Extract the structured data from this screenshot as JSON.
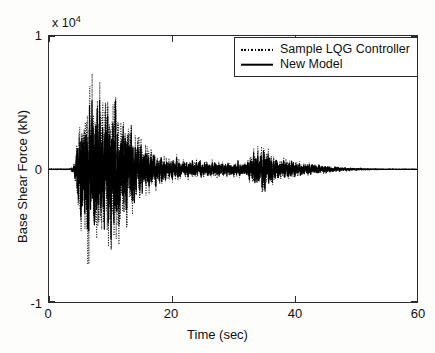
{
  "chart_data": {
    "type": "line",
    "title": "",
    "xlabel": "Time (sec)",
    "ylabel": "Base Shear Force (kN)",
    "y_multiplier": "x 10",
    "y_multiplier_exponent": "4",
    "xlim": [
      0,
      60
    ],
    "ylim": [
      -1,
      1
    ],
    "xticks": [
      0,
      20,
      40,
      60
    ],
    "xtick_labels": [
      "0",
      "20",
      "40",
      "60"
    ],
    "yticks": [
      -1,
      0,
      1
    ],
    "ytick_labels": [
      "-1",
      "0",
      "1"
    ],
    "grid": false,
    "legend_position": "top-right",
    "series": [
      {
        "name": "Sample LQG Controller",
        "style": "dotted",
        "color": "#000000",
        "peak_positive": 8700,
        "peak_negative": -9000,
        "peak_positive_time": 9.2,
        "peak_negative_time": 10.6
      },
      {
        "name": "New Model",
        "style": "solid",
        "color": "#000000",
        "peak_positive": 7800,
        "peak_negative": -8200,
        "peak_positive_time": 9.2,
        "peak_negative_time": 10.4
      }
    ],
    "envelope_description": "Seismic base shear response: near-zero 0-4 s, strong shaking 4-16 s peaking near +/-0.9e4 kN around 6-11 s, decaying 16-32 s, secondary burst near 34-36 s reaching about +/-0.3e4 kN, then decaying to near zero by 48-60 s.",
    "envelope_markers": [
      {
        "time": 0,
        "amplitude": 150
      },
      {
        "time": 4,
        "amplitude": 300
      },
      {
        "time": 5,
        "amplitude": 5800
      },
      {
        "time": 6.5,
        "amplitude": 8600
      },
      {
        "time": 9.2,
        "amplitude": 8700
      },
      {
        "time": 10.6,
        "amplitude": 9000
      },
      {
        "time": 12,
        "amplitude": 6000
      },
      {
        "time": 14,
        "amplitude": 4200
      },
      {
        "time": 16,
        "amplitude": 2400
      },
      {
        "time": 20,
        "amplitude": 1200
      },
      {
        "time": 26,
        "amplitude": 900
      },
      {
        "time": 32,
        "amplitude": 800
      },
      {
        "time": 34.8,
        "amplitude": 3000
      },
      {
        "time": 37,
        "amplitude": 1400
      },
      {
        "time": 42,
        "amplitude": 700
      },
      {
        "time": 48,
        "amplitude": 250
      },
      {
        "time": 55,
        "amplitude": 120
      },
      {
        "time": 60,
        "amplitude": 80
      }
    ]
  },
  "legend": {
    "entries": [
      {
        "label": "Sample LQG Controller",
        "marker": "dotted-line-sample"
      },
      {
        "label": "New Model",
        "marker": "solid-line-sample"
      }
    ]
  },
  "axes": {
    "x_title": "Time (sec)",
    "y_title": "Base Shear Force (kN)",
    "x_tick_labels": [
      "0",
      "20",
      "40",
      "60"
    ],
    "y_tick_labels": [
      "1",
      "0",
      "-1"
    ],
    "multiplier_prefix": "x 10",
    "multiplier_exponent": "4"
  }
}
